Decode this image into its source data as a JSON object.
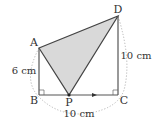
{
  "figure": {
    "points": {
      "A": {
        "label": "A",
        "x": 39,
        "y": 48
      },
      "B": {
        "label": "B",
        "x": 39,
        "y": 95
      },
      "P": {
        "label": "P",
        "x": 69,
        "y": 95
      },
      "C": {
        "label": "C",
        "x": 118,
        "y": 95
      },
      "D": {
        "label": "D",
        "x": 118,
        "y": 16
      }
    },
    "dimensions": {
      "AB": "6 cm",
      "CD": "10 cm",
      "BC": "10 cm"
    },
    "shaded_triangle": "APD",
    "colors": {
      "line": "#555555",
      "shade": "#d9d9d9",
      "dotted": "#b5b5b5",
      "text": "#333333"
    }
  }
}
